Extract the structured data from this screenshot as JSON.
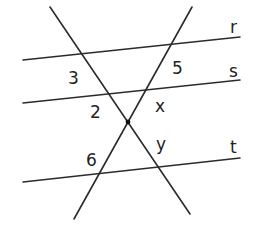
{
  "diagram": {
    "part_label_fragment": ")",
    "parallel_lines": [
      {
        "name": "r",
        "label": "r"
      },
      {
        "name": "s",
        "label": "s"
      },
      {
        "name": "t",
        "label": "t"
      }
    ],
    "angle_labels": {
      "a3": "3",
      "a5": "5",
      "a2": "2",
      "ax": "x",
      "a6": "6",
      "ay": "y"
    },
    "colors": {
      "line": "#2b2b2b",
      "text": "#222222",
      "background": "#ffffff"
    }
  }
}
